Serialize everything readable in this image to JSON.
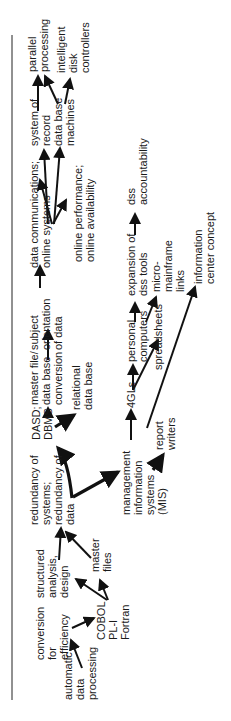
{
  "diagram": {
    "orientation": "rotated-90-ccw",
    "nodes": [
      {
        "id": "adp",
        "lines": [
          "automatic",
          "data",
          "processing"
        ]
      },
      {
        "id": "conv",
        "lines": [
          "conversion",
          "for",
          "efficiency"
        ]
      },
      {
        "id": "cobol",
        "lines": [
          "COBOL",
          "PL-I",
          "Fortran"
        ]
      },
      {
        "id": "struct",
        "lines": [
          "structured",
          "analysis,",
          "design"
        ]
      },
      {
        "id": "master",
        "lines": [
          "master",
          "files"
        ]
      },
      {
        "id": "redund",
        "lines": [
          "redundancy of",
          "systems;",
          "redundancy of",
          "data"
        ]
      },
      {
        "id": "mis",
        "lines": [
          "management",
          "information",
          "systems",
          "(MIS)"
        ]
      },
      {
        "id": "report",
        "lines": [
          "report",
          "writers"
        ]
      },
      {
        "id": "dasd",
        "lines": [
          "DASD;",
          "DBMS"
        ]
      },
      {
        "id": "mfconv",
        "lines": [
          "master file/",
          "data base",
          "conversion"
        ]
      },
      {
        "id": "reldb",
        "lines": [
          "relational",
          "data base"
        ]
      },
      {
        "id": "4gl",
        "lines": [
          "4GLs"
        ]
      },
      {
        "id": "pc",
        "lines": [
          "personal",
          "computers"
        ]
      },
      {
        "id": "spread",
        "lines": [
          "spreadsheets"
        ]
      },
      {
        "id": "subject",
        "lines": [
          "subject",
          "orientation",
          "of data"
        ]
      },
      {
        "id": "expdss",
        "lines": [
          "expansion of",
          "dss tools"
        ]
      },
      {
        "id": "micro",
        "lines": [
          "micro-",
          "mainframe",
          "links"
        ]
      },
      {
        "id": "infoctr",
        "lines": [
          "information",
          "center concept"
        ]
      },
      {
        "id": "datacomm",
        "lines": [
          "data communications;",
          "online systems"
        ]
      },
      {
        "id": "onlineperf",
        "lines": [
          "online performance;",
          "online availability"
        ]
      },
      {
        "id": "dss",
        "lines": [
          "dss",
          "accountability"
        ]
      },
      {
        "id": "sysrec",
        "lines": [
          "system of",
          "record"
        ]
      },
      {
        "id": "dbm",
        "lines": [
          "data base",
          "machines"
        ]
      },
      {
        "id": "parallel",
        "lines": [
          "parallel",
          "processing"
        ]
      },
      {
        "id": "idc",
        "lines": [
          "intelligent",
          "disk",
          "controllers"
        ]
      }
    ],
    "edges": [
      [
        "adp",
        "conv"
      ],
      [
        "conv",
        "cobol"
      ],
      [
        "cobol",
        "struct"
      ],
      [
        "cobol",
        "master"
      ],
      [
        "struct",
        "redund"
      ],
      [
        "master",
        "redund"
      ],
      [
        "redund",
        "dasd"
      ],
      [
        "redund",
        "mis"
      ],
      [
        "mis",
        "report"
      ],
      [
        "mis",
        "4gl"
      ],
      [
        "dasd",
        "mfconv"
      ],
      [
        "dasd",
        "reldb"
      ],
      [
        "4gl",
        "pc"
      ],
      [
        "4gl",
        "spread"
      ],
      [
        "report",
        "infoctr"
      ],
      [
        "mfconv",
        "subject"
      ],
      [
        "pc",
        "expdss"
      ],
      [
        "pc",
        "micro"
      ],
      [
        "subject",
        "datacomm"
      ],
      [
        "datacomm",
        "onlineperf"
      ],
      [
        "datacomm",
        "sysrec"
      ],
      [
        "datacomm",
        "dbm"
      ],
      [
        "expdss",
        "dss"
      ],
      [
        "sysrec",
        "parallel"
      ],
      [
        "dbm",
        "parallel"
      ],
      [
        "dbm",
        "idc"
      ]
    ]
  }
}
